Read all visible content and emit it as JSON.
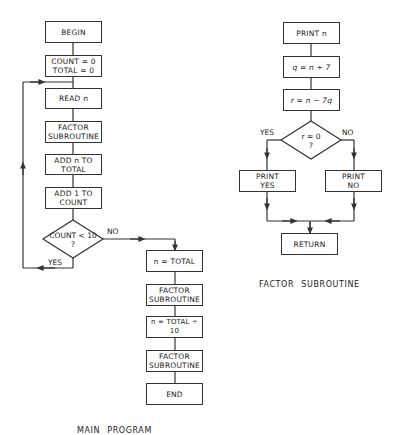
{
  "main_program": {
    "caption": "MAIN PROGRAM",
    "steps": [
      {
        "id": "begin",
        "label": "BEGIN"
      },
      {
        "id": "init",
        "label": "COUNT = 0\nTOTAL = 0"
      },
      {
        "id": "read",
        "label": "READ n"
      },
      {
        "id": "factor1",
        "label": "FACTOR\nSUBROUTINE"
      },
      {
        "id": "add-total",
        "label": "ADD n TO\nTOTAL"
      },
      {
        "id": "add-count",
        "label": "ADD 1 TO\nCOUNT"
      },
      {
        "id": "decision",
        "label": "COUNT  < 10\n?"
      },
      {
        "id": "set-n-total",
        "label": "n = TOTAL"
      },
      {
        "id": "factor2",
        "label": "FACTOR\nSUBROUTINE"
      },
      {
        "id": "set-n-div",
        "label": "n = TOTAL ÷ 10"
      },
      {
        "id": "factor3",
        "label": "FACTOR\nSUBROUTINE"
      },
      {
        "id": "end",
        "label": "END"
      }
    ],
    "decision_yes": "YES",
    "decision_no": "NO"
  },
  "factor_subroutine": {
    "caption": "FACTOR SUBROUTINE",
    "steps": [
      {
        "id": "print-n",
        "label": "PRINT n"
      },
      {
        "id": "q",
        "label": "q = n ÷ 7"
      },
      {
        "id": "r",
        "label": "r = n − 7q"
      },
      {
        "id": "decision",
        "label": "r = 0\n?"
      },
      {
        "id": "print-yes",
        "label": "PRINT\nYES"
      },
      {
        "id": "print-no",
        "label": "PRINT\nNO"
      },
      {
        "id": "return",
        "label": "RETURN"
      }
    ],
    "decision_yes": "YES",
    "decision_no": "NO"
  }
}
